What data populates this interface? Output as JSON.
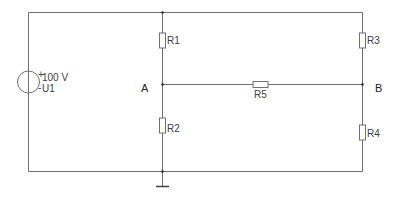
{
  "diagram": {
    "type": "electrical-circuit-schematic",
    "source": {
      "name": "U1",
      "value": "100 V",
      "plus_sign": "+",
      "minus_sign": "-"
    },
    "resistors": [
      {
        "name": "R1",
        "label": "R1"
      },
      {
        "name": "R2",
        "label": "R2"
      },
      {
        "name": "R3",
        "label": "R3"
      },
      {
        "name": "R4",
        "label": "R4"
      },
      {
        "name": "R5",
        "label": "R5"
      }
    ],
    "nodes": {
      "a": "A",
      "b": "B"
    },
    "ground": "ground",
    "colors": {
      "wire": "#707070",
      "text": "#404040",
      "background": "#ffffff"
    }
  }
}
